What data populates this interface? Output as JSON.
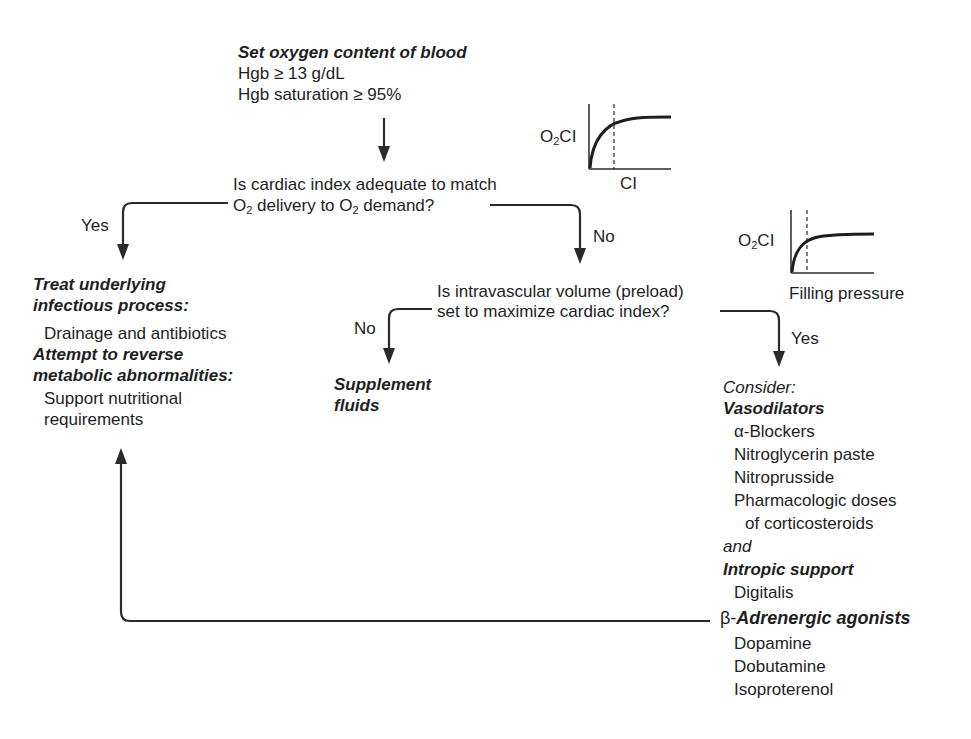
{
  "start": {
    "title": "Set oxygen content of blood",
    "lines": [
      "Hgb ≥ 13 g/dL",
      "Hgb saturation ≥ 95%"
    ]
  },
  "question1": {
    "line1": "Is cardiac index adequate to match",
    "line2_parts": [
      "O",
      "2",
      " delivery to O",
      "2",
      " demand?"
    ]
  },
  "inset_chart_1": {
    "ylabel_main": "O",
    "ylabel_sub": "2",
    "ylabel_tail": "CI",
    "xlabel": "CI"
  },
  "inset_chart_2": {
    "ylabel_main": "O",
    "ylabel_sub": "2",
    "ylabel_tail": "CI",
    "xlabel": "Filling pressure"
  },
  "branches": {
    "q1_yes": "Yes",
    "q1_no": "No",
    "q2_no": "No",
    "q2_yes": "Yes"
  },
  "left_box": {
    "heading1_line1": "Treat underlying",
    "heading1_line2": "infectious process:",
    "item1": "Drainage and antibiotics",
    "heading2_line1": "Attempt to reverse",
    "heading2_line2": "metabolic abnormalities:",
    "item2_line1": "Support nutritional",
    "item2_line2": "requirements"
  },
  "question2": {
    "line1": "Is intravascular volume (preload)",
    "line2": "set to maximize cardiac index?"
  },
  "fluids": {
    "line1": "Supplement",
    "line2": "fluids"
  },
  "consider": {
    "intro": "Consider:",
    "vasodilators_heading": "Vasodilators",
    "vasodilators": [
      "α-Blockers",
      "Nitroglycerin paste",
      "Nitroprusside",
      "Pharmacologic doses"
    ],
    "vasodilators_cont": "of corticosteroids",
    "and": "and",
    "inotropic_heading": "Intropic support",
    "inotropic_item": "Digitalis",
    "beta_prefix": "β-",
    "beta_heading": "Adrenergic agonists",
    "beta_items": [
      "Dopamine",
      "Dobutamine",
      "Isoproterenol"
    ]
  }
}
